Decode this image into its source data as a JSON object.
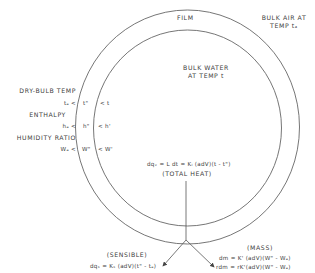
{
  "regions": {
    "film": "FILM",
    "bulk_air_line1": "BULK AIR AT",
    "bulk_air_line2": "TEMP tₐ",
    "bulk_water_line1": "BULK WATER",
    "bulk_water_line2": "AT TEMP t"
  },
  "properties": {
    "dry_bulb": {
      "title": "DRY-BULB TEMP",
      "air": "tₐ <",
      "film": "t\"",
      "water": "< t"
    },
    "enthalpy": {
      "title": "ENTHALPY",
      "air": "hₐ <",
      "film": "h\"",
      "water": "< h'"
    },
    "humidity": {
      "title": "HUMIDITY RATIO",
      "air": "Wₐ <",
      "film": "W\"",
      "water": "< W'"
    }
  },
  "total_heat": {
    "equation": "dqᵥ = L dt = Kₗ (adV)(t - t\")",
    "label": "(TOTAL HEAT)"
  },
  "sensible": {
    "label": "(SENSIBLE)",
    "equation": "dqₛ = Kₛ (adV)(t\" - tₐ)"
  },
  "mass": {
    "label": "(MASS)",
    "equation1": "dm = K' (adV)(W\" - Wₐ)",
    "equation2": "rdm = rK'(adV)(W\" - Wₐ)"
  },
  "colors": {
    "line": "#555555",
    "text": "#404040",
    "background": "#ffffff"
  }
}
